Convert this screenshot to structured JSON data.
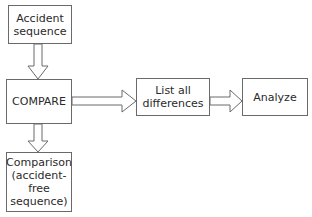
{
  "diagram": {
    "type": "flowchart",
    "nodes": [
      {
        "id": "accident",
        "lines": [
          "Accident",
          "sequence"
        ]
      },
      {
        "id": "compare",
        "lines": [
          "COMPARE"
        ]
      },
      {
        "id": "comparison",
        "lines": [
          "Comparison",
          "(accident-",
          "free",
          "sequence)"
        ]
      },
      {
        "id": "differences",
        "lines": [
          "List all",
          "differences"
        ]
      },
      {
        "id": "analyze",
        "lines": [
          "Analyze"
        ]
      }
    ],
    "edges": [
      {
        "from": "accident",
        "to": "compare",
        "style": "hollow-block-arrow",
        "direction": "down"
      },
      {
        "from": "compare",
        "to": "comparison",
        "style": "hollow-block-arrow",
        "direction": "down"
      },
      {
        "from": "compare",
        "to": "differences",
        "style": "hollow-block-arrow",
        "direction": "right"
      },
      {
        "from": "differences",
        "to": "analyze",
        "style": "hollow-block-arrow",
        "direction": "right"
      }
    ],
    "colors": {
      "stroke": "#6a6a6a",
      "text": "#2a2a2a",
      "background": "#ffffff"
    }
  }
}
